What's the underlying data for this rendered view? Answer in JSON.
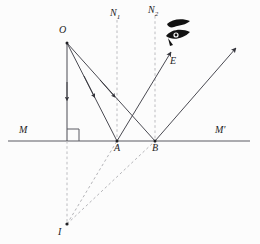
{
  "figure": {
    "type": "optics-ray-diagram",
    "background_color": "#fcfcfc",
    "stroke_color": "#4a4a52",
    "dash_color": "#b9b9bd",
    "ink_color": "#111111"
  },
  "labels": {
    "object": "O",
    "normal_1": "N",
    "normal_1_sub": "1",
    "normal_2": "N",
    "normal_2_sub": "2",
    "eye": "E",
    "mirror_left": "M",
    "mirror_right": "M'",
    "point_a": "A",
    "point_b": "B",
    "image": "I"
  },
  "geometry": {
    "mirror_line": {
      "x1": 8,
      "y1": 141,
      "x2": 250,
      "y2": 141
    },
    "object_point": {
      "x": 67,
      "y": 42
    },
    "image_point": {
      "x": 67,
      "y": 224
    },
    "point_a": {
      "x": 117,
      "y": 141
    },
    "point_b": {
      "x": 155,
      "y": 141
    },
    "normal_1_line": {
      "x": 117,
      "y_top": 20,
      "y_bottom": 148
    },
    "normal_2_line": {
      "x": 155,
      "y_top": 16,
      "y_bottom": 148
    },
    "vertical_drop": {
      "x": 67,
      "y_top": 42,
      "y_bottom": 141
    },
    "image_drop_dashed": {
      "x": 67,
      "y_top": 141,
      "y_bottom": 224
    },
    "right_angle_marker": {
      "x": 67,
      "y": 141,
      "size": 12
    },
    "reflected_ray_to_eye": {
      "x1": 117,
      "y1": 141,
      "x2": 170,
      "y2": 50
    },
    "reflected_ray_far": {
      "x1": 155,
      "y1": 141,
      "x2": 237,
      "y2": 47
    },
    "eye_icon": {
      "x": 178,
      "y": 30
    }
  },
  "elements": {
    "incident_ray_oa": "incident ray from O to A",
    "incident_ray_ob": "incident ray from O to B",
    "reflected_ray_ae": "reflected ray from A toward eye E",
    "reflected_ray_b": "reflected ray from B",
    "virtual_ray_ia": "virtual ray from image I through A",
    "virtual_ray_ib": "virtual ray from image I through B",
    "normal_at_a": "normal N1 at A",
    "normal_at_b": "normal N2 at B",
    "mirror_surface": "mirror surface MM'",
    "object_distance_line": "perpendicular from O to mirror",
    "image_distance_line": "perpendicular from mirror to I"
  }
}
